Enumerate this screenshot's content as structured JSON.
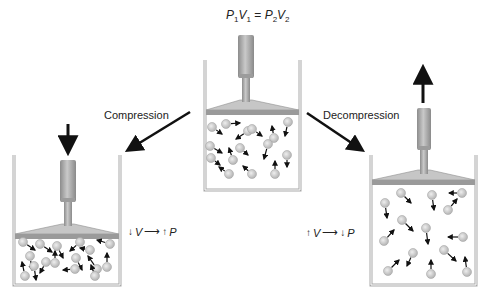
{
  "equation": {
    "P": "P",
    "V": "V",
    "sub1": "1",
    "sub2": "2",
    "eq": " = "
  },
  "labels": {
    "compression": "Compression",
    "decompression": "Decompression"
  },
  "relations": {
    "compression": {
      "v_dir": "↓",
      "v": "V",
      "arrow": "⟶",
      "p_dir": "↑",
      "p": "P"
    },
    "decompression": {
      "v_dir": "↑",
      "v": "V",
      "arrow": "⟶",
      "p_dir": "↓",
      "p": "P"
    }
  },
  "colors": {
    "wall": "#a9a9a9",
    "piston": "#9a9a9a",
    "piston_light": "#c6c6c6",
    "particle": "#c8c8c8",
    "arrow": "#111111"
  },
  "containers": [
    {
      "id": "center",
      "x": 205,
      "y": 60,
      "w": 95,
      "h": 130,
      "plate_y": 110,
      "cyl": {
        "x": 238,
        "y": 35,
        "w": 16,
        "h": 43
      },
      "rod": {
        "x": 242,
        "y": 78,
        "w": 8,
        "h": 24
      },
      "force_arrow": null,
      "particles": [
        [
          212,
          127,
          222,
          134
        ],
        [
          226,
          124,
          240,
          123
        ],
        [
          248,
          131,
          236,
          139
        ],
        [
          252,
          129,
          262,
          136
        ],
        [
          274,
          138,
          272,
          126
        ],
        [
          288,
          122,
          285,
          136
        ],
        [
          210,
          146,
          222,
          153
        ],
        [
          240,
          148,
          248,
          155
        ],
        [
          233,
          160,
          229,
          148
        ],
        [
          268,
          144,
          264,
          159
        ],
        [
          287,
          155,
          287,
          167
        ],
        [
          211,
          158,
          220,
          165
        ],
        [
          229,
          174,
          219,
          167
        ],
        [
          252,
          174,
          243,
          166
        ],
        [
          275,
          174,
          275,
          161
        ]
      ]
    },
    {
      "id": "left",
      "x": 14,
      "y": 155,
      "w": 106,
      "h": 130,
      "plate_y": 234,
      "cyl": {
        "x": 60,
        "y": 160,
        "w": 16,
        "h": 42
      },
      "rod": {
        "x": 64,
        "y": 202,
        "w": 8,
        "h": 24
      },
      "force_arrow": {
        "x": 68,
        "y1": 124,
        "y2": 152
      },
      "particles": [
        [
          23,
          242,
          35,
          250
        ],
        [
          40,
          244,
          52,
          252
        ],
        [
          57,
          246,
          63,
          258
        ],
        [
          80,
          242,
          70,
          251
        ],
        [
          110,
          244,
          97,
          240
        ],
        [
          30,
          256,
          32,
          270
        ],
        [
          46,
          262,
          40,
          273
        ],
        [
          55,
          263,
          55,
          251
        ],
        [
          76,
          258,
          82,
          270
        ],
        [
          97,
          269,
          88,
          256
        ],
        [
          25,
          276,
          22,
          262
        ],
        [
          34,
          266,
          36,
          280
        ],
        [
          75,
          269,
          63,
          270
        ],
        [
          95,
          276,
          91,
          265
        ],
        [
          107,
          267,
          107,
          253
        ],
        [
          90,
          250,
          80,
          248
        ]
      ]
    },
    {
      "id": "right",
      "x": 371,
      "y": 155,
      "w": 105,
      "h": 130,
      "plate_y": 180,
      "cyl": {
        "x": 417,
        "y": 108,
        "w": 14,
        "h": 42
      },
      "rod": {
        "x": 420,
        "y": 150,
        "w": 8,
        "h": 24
      },
      "force_arrow": {
        "x": 423,
        "y1": 103,
        "y2": 68,
        "up": true
      },
      "particles": [
        [
          401,
          193,
          411,
          203
        ],
        [
          432,
          195,
          434,
          210
        ],
        [
          462,
          193,
          449,
          193
        ],
        [
          385,
          203,
          387,
          218
        ],
        [
          448,
          210,
          457,
          199
        ],
        [
          402,
          220,
          413,
          231
        ],
        [
          426,
          228,
          428,
          244
        ],
        [
          463,
          237,
          448,
          237
        ],
        [
          384,
          241,
          394,
          230
        ],
        [
          413,
          253,
          407,
          266
        ],
        [
          444,
          250,
          456,
          261
        ],
        [
          388,
          271,
          399,
          260
        ],
        [
          431,
          274,
          431,
          260
        ],
        [
          467,
          272,
          465,
          257
        ]
      ]
    }
  ],
  "process_arrows": [
    {
      "name": "compression-arrow",
      "x1": 190,
      "y1": 112,
      "x2": 128,
      "y2": 150
    },
    {
      "name": "decompression-arrow",
      "x1": 307,
      "y1": 113,
      "x2": 362,
      "y2": 150
    }
  ]
}
